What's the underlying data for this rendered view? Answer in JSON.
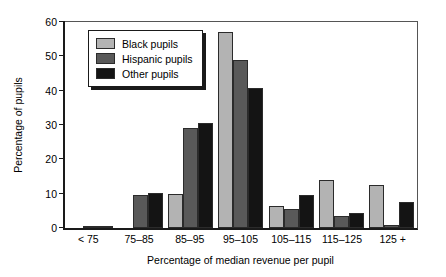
{
  "chart_data": {
    "type": "bar",
    "title": "",
    "xlabel": "Percentage of median revenue per pupil",
    "ylabel": "Percentage of pupils",
    "ylim": [
      0,
      60
    ],
    "yticks": [
      0,
      10,
      20,
      30,
      40,
      50,
      60
    ],
    "grid": false,
    "legend_position": "top-left",
    "categories": [
      "< 75",
      "75–85",
      "85–95",
      "95–105",
      "105–115",
      "115–125",
      "125 +"
    ],
    "series": [
      {
        "name": "Black pupils",
        "color": "#b3b3b3",
        "values": [
          0,
          0,
          10,
          57,
          6.5,
          14,
          12.5
        ]
      },
      {
        "name": "Hispanic pupils",
        "color": "#595959",
        "values": [
          0.3,
          9.5,
          29,
          49,
          5.5,
          3.5,
          1
        ]
      },
      {
        "name": "Other pupils",
        "color": "#141414",
        "values": [
          0.4,
          10.3,
          30.5,
          40.8,
          9.5,
          4.5,
          7.5
        ]
      }
    ]
  },
  "legend": {
    "items": [
      {
        "label": "Black pupils"
      },
      {
        "label": "Hispanic pupils"
      },
      {
        "label": "Other pupils"
      }
    ]
  }
}
